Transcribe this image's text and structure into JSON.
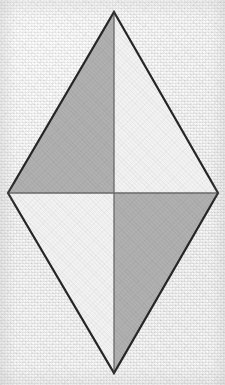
{
  "figure": {
    "shape_name": "rhombus",
    "canvas": {
      "width": 225,
      "height": 385
    },
    "colors": {
      "background": "#eeeeee",
      "outline": "#262626",
      "diagonal_line": "#6a6a6a",
      "shaded_fill": "#b0b0b0",
      "unshaded_fill": "#f2f2f2"
    },
    "stroke_widths": {
      "outline": 2.2,
      "diagonal": 1.3
    },
    "vertices": [
      {
        "name": "top",
        "label": "top-vertex",
        "x": 114,
        "y": 12
      },
      {
        "name": "right",
        "label": "right-vertex",
        "x": 218,
        "y": 193
      },
      {
        "name": "bottom",
        "label": "bottom-vertex",
        "x": 114,
        "y": 373
      },
      {
        "name": "left",
        "label": "left-vertex",
        "x": 8,
        "y": 193
      }
    ],
    "center": {
      "name": "center",
      "label": "diagonal-intersection",
      "x": 114,
      "y": 193
    },
    "outline_path": "M 114 12 L 218 193 L 114 373 L 8 193 Z",
    "diagonals": [
      {
        "name": "vertical-diagonal",
        "x1": 114,
        "y1": 12,
        "x2": 114,
        "y2": 373
      },
      {
        "name": "horizontal-diagonal",
        "x1": 8,
        "y1": 193,
        "x2": 218,
        "y2": 193
      }
    ],
    "regions": [
      {
        "name": "upper-left-triangle",
        "label": "upper-left",
        "shaded": true,
        "fill": "#b0b0b0",
        "points": "114,12 114,193 8,193"
      },
      {
        "name": "upper-right-triangle",
        "label": "upper-right",
        "shaded": false,
        "fill": "#f2f2f2",
        "points": "114,12 218,193 114,193"
      },
      {
        "name": "lower-right-triangle",
        "label": "lower-right",
        "shaded": true,
        "fill": "#b0b0b0",
        "points": "114,193 218,193 114,373"
      },
      {
        "name": "lower-left-triangle",
        "label": "lower-left",
        "shaded": false,
        "fill": "#f2f2f2",
        "points": "114,193 114,373 8,193"
      }
    ]
  }
}
